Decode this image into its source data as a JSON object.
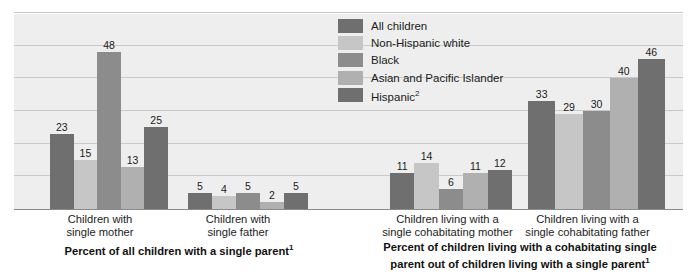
{
  "chart_data": {
    "type": "bar",
    "title": "",
    "xlabel": "",
    "ylabel": "",
    "ylim": [
      0,
      60
    ],
    "grid": true,
    "gridline_values": [
      10,
      20,
      30,
      40,
      50,
      60
    ],
    "legend_position": "top-center",
    "categories": [
      "Children with single mother",
      "Children with single father",
      "Children living with a single cohabitating mother",
      "Children living with a single cohabitating father"
    ],
    "series": [
      {
        "name": "All children",
        "color": "#6f6f6f",
        "values": [
          23,
          5,
          11,
          33
        ]
      },
      {
        "name": "Non-Hispanic white",
        "color": "#c6c6c6",
        "values": [
          15,
          4,
          14,
          29
        ]
      },
      {
        "name": "Black",
        "color": "#8c8c8c",
        "values": [
          48,
          5,
          6,
          30
        ]
      },
      {
        "name": "Asian and Pacific Islander",
        "color": "#b0b0b0",
        "values": [
          13,
          2,
          11,
          40
        ]
      },
      {
        "name": "Hispanic",
        "color": "#6f6f6f",
        "values": [
          25,
          5,
          12,
          46
        ]
      }
    ]
  },
  "legend": {
    "items": [
      {
        "label": "All children",
        "sup": "",
        "color": "#6f6f6f"
      },
      {
        "label": "Non-Hispanic white",
        "sup": "",
        "color": "#c6c6c6"
      },
      {
        "label": "Black",
        "sup": "",
        "color": "#8c8c8c"
      },
      {
        "label": "Asian and Pacific Islander",
        "sup": "",
        "color": "#b0b0b0"
      },
      {
        "label": "Hispanic",
        "sup": "2",
        "color": "#6f6f6f"
      }
    ]
  },
  "category_labels": [
    {
      "line1": "Children with",
      "line2": "single mother"
    },
    {
      "line1": "Children with",
      "line2": "single father"
    },
    {
      "line1": "Children living with a",
      "line2": "single cohabitating mother"
    },
    {
      "line1": "Children living with a",
      "line2": "single cohabitating father"
    }
  ],
  "section_captions": [
    {
      "line1": "Percent of all children with a single parent",
      "sup1": "1",
      "line2": "",
      "sup2": ""
    },
    {
      "line1": "Percent of children living with a cohabitating single",
      "sup1": "",
      "line2": "parent out of children living with a single parent",
      "sup2": "1"
    }
  ],
  "style": {
    "plot_background": "#eeeeee",
    "gridline_color": "#c9c9c9",
    "axis_color": "#8a8a8a",
    "page_background": "#ffffff",
    "text_color": "#1c1c1c"
  }
}
